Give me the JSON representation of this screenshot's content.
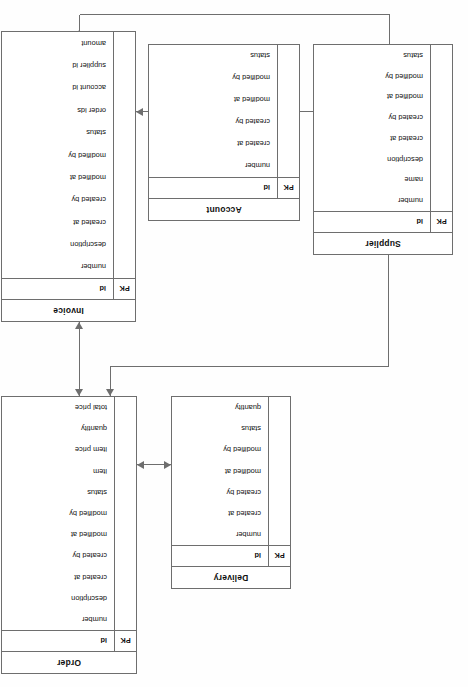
{
  "diagram": {
    "orientation_degrees": 180,
    "key_label": "PK",
    "entities": [
      {
        "id": "order",
        "name": "Order",
        "pk": {
          "key": "PK",
          "attr": "id"
        },
        "attributes": [
          "number",
          "description",
          "created at",
          "created by",
          "modified at",
          "modified by",
          "status",
          "item",
          "item price",
          "quantity",
          "total price"
        ]
      },
      {
        "id": "delivery",
        "name": "Delivery",
        "pk": {
          "key": "PK",
          "attr": "id"
        },
        "attributes": [
          "number",
          "created at",
          "created by",
          "modified at",
          "modified by",
          "status",
          "quantity"
        ]
      },
      {
        "id": "invoice",
        "name": "Invoice",
        "pk": {
          "key": "PK",
          "attr": "id"
        },
        "attributes": [
          "number",
          "description",
          "created at",
          "created by",
          "modified at",
          "modified by",
          "status",
          "order ids",
          "account id",
          "supplier id",
          "amount"
        ]
      },
      {
        "id": "supplier",
        "name": "Supplier",
        "pk": {
          "key": "PK",
          "attr": "id"
        },
        "attributes": [
          "number",
          "name",
          "description",
          "created at",
          "created by",
          "modified at",
          "modified by",
          "status"
        ]
      },
      {
        "id": "account",
        "name": "Account",
        "pk": {
          "key": "PK",
          "attr": "id"
        },
        "attributes": [
          "number",
          "created at",
          "created by",
          "modified at",
          "modified by",
          "status"
        ]
      }
    ],
    "relationships": [
      {
        "id": "delivery-order",
        "from": "Delivery",
        "to": "Order"
      },
      {
        "id": "order-invoice",
        "from": "Order",
        "to": "Invoice"
      },
      {
        "id": "order-supplier",
        "from": "Order",
        "to": "Supplier"
      },
      {
        "id": "supplier-account",
        "from": "Supplier",
        "to": "Account"
      },
      {
        "id": "account-invoice",
        "from": "Account",
        "to": "Invoice"
      },
      {
        "id": "supplier-invoice",
        "from": "Supplier",
        "to": "Invoice"
      }
    ],
    "colors": {
      "line": "#6e6e6e",
      "text": "#101010",
      "background": "#ffffff"
    }
  }
}
